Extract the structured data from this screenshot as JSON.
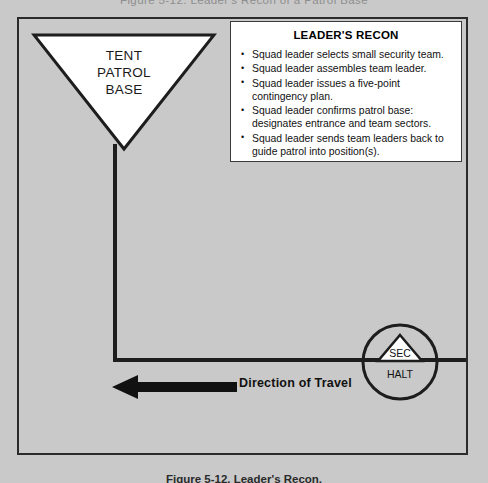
{
  "page": {
    "running_header": "Figure 5-12. Leader's Recon of a Patrol Base",
    "background_color": "#c9c9c9",
    "line_color": "#1d1d1d"
  },
  "figure": {
    "caption": "Figure 5-12. Leader's Recon.",
    "tent_patrol_base": {
      "label": "TENT\nPATROL\nBASE",
      "lines": [
        "TENT",
        "PATROL",
        "BASE"
      ],
      "fill_color": "#ffffff",
      "stroke_color": "#1d1d1d"
    },
    "recon_box": {
      "title": "LEADER'S RECON",
      "items": [
        "Squad leader selects small security team.",
        "Squad leader assembles team leader.",
        "Squad leader issues a five-point contingency plan.",
        "Squad leader confirms patrol base: designates entrance and team sectors.",
        "Squad leader sends team leaders back to guide patrol into position(s)."
      ],
      "background_color": "#ffffff",
      "border_color": "#3a3a3a"
    },
    "halt_marker": {
      "security_label": "SEC",
      "halt_label": "HALT",
      "shape": "circle-with-triangle",
      "stroke_color": "#1d1d1d"
    },
    "direction_of_travel": {
      "label": "Direction of Travel",
      "arrow_direction": "left",
      "arrow_color": "#111111"
    }
  }
}
